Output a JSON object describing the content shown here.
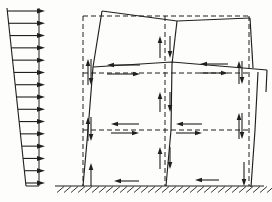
{
  "figure": {
    "meta": {
      "name": "frame-under-lateral-wind-load-diagram",
      "canvas": {
        "w": 272,
        "h": 202
      },
      "ink": "#1f1f1f",
      "background": "#fdfdfc",
      "dash_pattern": "5 3",
      "force_arrow_head": {
        "len": 7,
        "w": 4.6
      }
    },
    "wind_load": {
      "count": 15,
      "first_y": 11,
      "last_y": 183,
      "left_edge": [
        [
          7,
          8
        ],
        [
          26,
          186
        ]
      ],
      "right_edge": [
        [
          39,
          8
        ],
        [
          39,
          186
        ]
      ],
      "bottom_edge": [
        [
          26,
          186
        ],
        [
          39,
          186
        ]
      ],
      "tip_x": 45,
      "head": {
        "len": 8,
        "w": 5
      }
    },
    "dashed_frame": {
      "columns_x": [
        83,
        165,
        249
      ],
      "beams_y": [
        16,
        73,
        130
      ],
      "top_y": 16,
      "bottom_y": 186,
      "left_x": 83,
      "right_x": 249
    },
    "deformed_frame": {
      "polylines": [
        {
          "name": "left-column-lower",
          "pts": [
            [
              83,
              186
            ],
            [
              88,
              130
            ],
            [
              93,
              67
            ]
          ]
        },
        {
          "name": "left-column-upper",
          "pts": [
            [
              93,
              67
            ],
            [
              102,
              11
            ]
          ]
        },
        {
          "name": "middle-column-lower",
          "pts": [
            [
              166,
              186
            ],
            [
              171,
              130
            ],
            [
              172,
              64
            ]
          ]
        },
        {
          "name": "middle-column-upper",
          "pts": [
            [
              172,
              64
            ],
            [
              177,
              21
            ]
          ]
        },
        {
          "name": "right-column-lower",
          "pts": [
            [
              251,
              187
            ],
            [
              255,
              130
            ],
            [
              258,
              72
            ]
          ]
        },
        {
          "name": "right-column-upper",
          "pts": [
            [
              253,
              68
            ],
            [
              250,
              18
            ]
          ]
        },
        {
          "name": "roof-beam",
          "pts": [
            [
              102,
              11
            ],
            [
              177,
              21
            ],
            [
              250,
              18
            ]
          ]
        },
        {
          "name": "floor-beam",
          "pts": [
            [
              93,
              67
            ],
            [
              172,
              62
            ],
            [
              267,
              70
            ]
          ]
        },
        {
          "name": "floor-beam-end-stub",
          "pts": [
            [
              267,
              70
            ],
            [
              266,
              92
            ]
          ]
        }
      ]
    },
    "force_couples": {
      "vertical_pairs": [
        {
          "name": "upper-level-left-end",
          "x_up": 88,
          "x_down": 91,
          "y_top": 59,
          "y_bot": 85
        },
        {
          "name": "upper-level-right-end",
          "x_up": 239,
          "x_down": 242,
          "y_top": 61,
          "y_bot": 84
        },
        {
          "name": "lower-level-left-end",
          "x_up": 88,
          "x_down": 91,
          "y_top": 117,
          "y_bot": 141
        },
        {
          "name": "lower-level-right-end",
          "x_up": 239,
          "x_down": 242,
          "y_top": 113,
          "y_bot": 139
        },
        {
          "name": "mid-column-top-story",
          "x_up": 160,
          "x_down": 170,
          "y_top": 36,
          "y_bot": 58
        },
        {
          "name": "mid-column-middle-story",
          "x_up": 160,
          "x_down": 170,
          "y_top": 92,
          "y_bot": 112
        },
        {
          "name": "mid-column-bottom-story",
          "x_up": 160,
          "x_down": 170,
          "y_top": 147,
          "y_bot": 169
        }
      ],
      "horizontal_pairs": [
        {
          "name": "upper-level-left-bay",
          "x_left": 107,
          "x_right": 140,
          "y_upper": 65,
          "y_lower": 74
        },
        {
          "name": "upper-level-right-bay",
          "x_left": 200,
          "x_right": 228,
          "y_upper": 64,
          "y_lower": 73
        },
        {
          "name": "lower-level-left-bay",
          "x_left": 111,
          "x_right": 139,
          "y_upper": 124,
          "y_lower": 133
        },
        {
          "name": "lower-level-right-bay",
          "x_left": 176,
          "x_right": 202,
          "y_upper": 124,
          "y_lower": 133
        }
      ]
    },
    "base_forces": {
      "left_uplift": {
        "x": 91,
        "y_from": 186,
        "y_to": 163
      },
      "right_downthrust": {
        "x": 244,
        "y_from": 162,
        "y_to": 186
      },
      "left_bay_shear": {
        "y": 181,
        "x_from": 139,
        "x_to": 114
      },
      "right_bay_shear": {
        "y": 180,
        "x_from": 219,
        "x_to": 195
      }
    },
    "ground": {
      "y": 186,
      "x1": 55,
      "x2": 264,
      "hatch": {
        "x1": 57,
        "x2": 268,
        "step": 7,
        "len": 7,
        "drop": 6.5
      }
    }
  }
}
